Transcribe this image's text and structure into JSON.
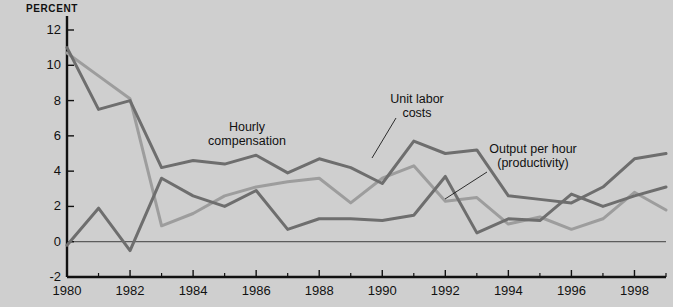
{
  "chart_data": {
    "type": "line",
    "title": "",
    "subtitle": "",
    "xlabel": "",
    "ylabel": "PERCENT",
    "xlim": [
      1980,
      1999
    ],
    "ylim": [
      -2,
      12
    ],
    "yticks": [
      -2,
      0,
      2,
      4,
      6,
      8,
      10,
      12
    ],
    "ytick_labels": [
      "-2",
      "0",
      "2",
      "4",
      "6",
      "8",
      "10",
      "12"
    ],
    "xticks": [
      1980,
      1982,
      1984,
      1986,
      1988,
      1990,
      1992,
      1994,
      1996,
      1998
    ],
    "xtick_labels": [
      "1980",
      "1982",
      "1984",
      "1986",
      "1988",
      "1990",
      "1992",
      "1994",
      "1996",
      "1998"
    ],
    "minor_xticks": [
      1981,
      1983,
      1985,
      1987,
      1989,
      1991,
      1993,
      1995,
      1997,
      1999
    ],
    "grid": false,
    "zero_line": true,
    "legend_position": "inline-annotations",
    "x": [
      1980,
      1981,
      1982,
      1983,
      1984,
      1985,
      1986,
      1987,
      1988,
      1989,
      1990,
      1991,
      1992,
      1993,
      1994,
      1995,
      1996,
      1997,
      1998,
      1999
    ],
    "series": [
      {
        "name": "Hourly compensation",
        "color": "#6e6e6e",
        "values": [
          11.0,
          7.5,
          8.0,
          4.2,
          4.6,
          4.4,
          4.9,
          3.9,
          4.7,
          4.2,
          3.3,
          5.7,
          5.0,
          5.2,
          2.6,
          2.4,
          2.2,
          3.1,
          4.7,
          5.0
        ]
      },
      {
        "name": "Unit labor costs",
        "color": "#9d9d9d",
        "values": [
          10.7,
          9.4,
          8.1,
          0.9,
          1.6,
          2.6,
          3.1,
          3.4,
          3.6,
          2.2,
          3.6,
          4.3,
          2.3,
          2.5,
          1.0,
          1.4,
          0.7,
          1.3,
          2.8,
          1.8
        ]
      },
      {
        "name": "Output per hour (productivity)",
        "color": "#6e6e6e",
        "values": [
          -0.2,
          1.9,
          -0.5,
          3.6,
          2.6,
          2.0,
          2.9,
          0.7,
          1.3,
          1.3,
          1.2,
          1.5,
          3.7,
          0.5,
          1.3,
          1.2,
          2.7,
          2.0,
          2.6,
          3.1
        ]
      }
    ],
    "annotations": [
      {
        "key": "hourly",
        "text": "Hourly\ncompensation"
      },
      {
        "key": "ulc",
        "text": "Unit labor\ncosts"
      },
      {
        "key": "oph",
        "text": "Output per hour\n(productivity)"
      }
    ],
    "colors": {
      "background": "#cfcfcf",
      "axis": "#111111",
      "dark_series": "#6e6e6e",
      "light_series": "#9d9d9d",
      "text": "#111111"
    }
  }
}
